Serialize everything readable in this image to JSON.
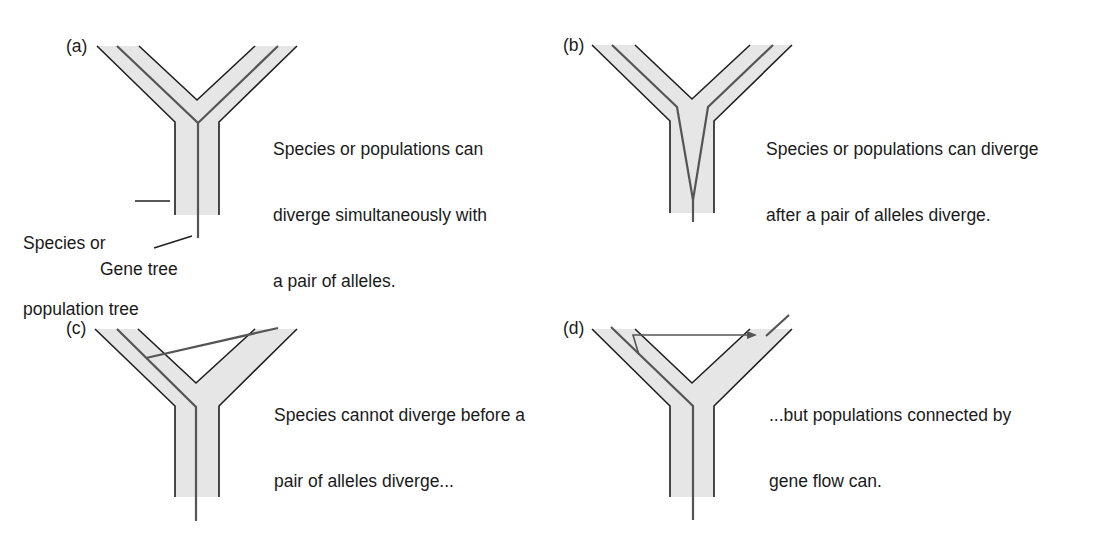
{
  "figure": {
    "colors": {
      "band": "#e6e6e6",
      "outline": "#1f1f1f",
      "gene": "#555555"
    },
    "panels": [
      {
        "id": "a",
        "label": "(a)",
        "caption_lines": [
          "Species or populations can",
          "diverge simultaneously with",
          "a pair of alleles."
        ]
      },
      {
        "id": "b",
        "label": "(b)",
        "caption_lines": [
          "Species or populations can diverge",
          "after a pair of alleles diverge."
        ]
      },
      {
        "id": "c",
        "label": "(c)",
        "caption_lines": [
          "Species cannot diverge before a",
          "pair of alleles diverge..."
        ]
      },
      {
        "id": "d",
        "label": "(d)",
        "caption_lines": [
          "...but populations connected by",
          "gene flow can."
        ]
      }
    ],
    "legend": {
      "species_tree_line1": "Species or",
      "species_tree_line2": "population tree",
      "gene_tree": "Gene tree"
    }
  }
}
